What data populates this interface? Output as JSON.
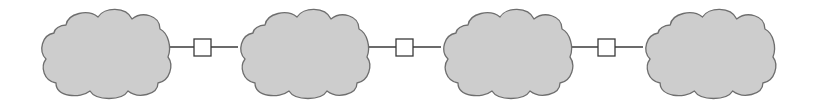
{
  "diagram": {
    "type": "network-chain",
    "colors": {
      "cloud_fill": "#cdcdcd",
      "cloud_stroke": "#6e6e6e",
      "link_stroke": "#3a3a3a",
      "box_fill": "#ffffff",
      "background": "#ffffff"
    },
    "clouds": [
      {
        "id": "cloud-1",
        "x": 38,
        "y": 7,
        "width": 133,
        "height": 90
      },
      {
        "id": "cloud-2",
        "x": 237,
        "y": 7,
        "width": 133,
        "height": 90
      },
      {
        "id": "cloud-3",
        "x": 440,
        "y": 7,
        "width": 133,
        "height": 90
      },
      {
        "id": "cloud-4",
        "x": 642,
        "y": 7,
        "width": 134,
        "height": 90
      }
    ],
    "links": [
      {
        "id": "link-1",
        "from": "cloud-1",
        "to": "cloud-2",
        "x1": 169,
        "x2": 238,
        "y": 47,
        "box": {
          "x": 194,
          "y": 39,
          "size": 17
        }
      },
      {
        "id": "link-2",
        "from": "cloud-2",
        "to": "cloud-3",
        "x1": 368,
        "x2": 441,
        "y": 47,
        "box": {
          "x": 396,
          "y": 39,
          "size": 17
        }
      },
      {
        "id": "link-3",
        "from": "cloud-3",
        "to": "cloud-4",
        "x1": 571,
        "x2": 643,
        "y": 47,
        "box": {
          "x": 598,
          "y": 39,
          "size": 17
        }
      }
    ]
  }
}
